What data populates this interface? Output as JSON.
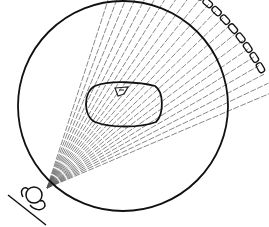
{
  "diagram": {
    "title": "Fan-beam CT scan geometry",
    "elements": {
      "gantry_circle": {
        "label": "Scan circle",
        "cx": 123,
        "cy": 106,
        "r": 105
      },
      "source": {
        "label": "X-ray tube",
        "x": 47,
        "y": 188
      },
      "detector": {
        "label": "Detector array",
        "cells": 15
      },
      "object": {
        "label": "Patient cross-section"
      },
      "feature": {
        "label": "Internal structure"
      },
      "fan_beam": {
        "label": "Fan beam",
        "ray_count": 22
      }
    },
    "colors": {
      "stroke": "#111111",
      "ray": "#555555",
      "background": "#ffffff"
    }
  }
}
